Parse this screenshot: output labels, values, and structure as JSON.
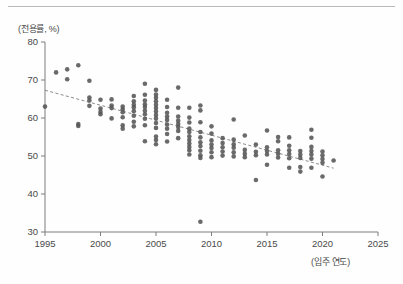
{
  "figure": {
    "top_rule": true,
    "background_color": "#fefefe"
  },
  "chart_data": {
    "type": "scatter",
    "title": "",
    "subtitle": "",
    "xlabel": "(입주 연도)",
    "ylabel": "(전용률, %)",
    "xlim": [
      1995,
      2025
    ],
    "ylim": [
      30,
      80
    ],
    "xticks": [
      1995,
      2000,
      2005,
      2010,
      2015,
      2020,
      2025
    ],
    "xtick_labels": [
      "1995",
      "2000",
      "2005",
      "2010",
      "2015",
      "2020",
      "2025"
    ],
    "yticks": [
      30,
      40,
      50,
      60,
      70,
      80
    ],
    "ytick_labels": [
      "30",
      "40",
      "50",
      "60",
      "70",
      "80"
    ],
    "grid": false,
    "legend": null,
    "marker": {
      "shape": "circle",
      "color": "#555555",
      "size_px": 4.6,
      "opacity": 0.88
    },
    "trendline": {
      "style": "dashed",
      "color": "#8a8a8a",
      "x_start": 1995,
      "y_start": 67.3,
      "x_end": 2021,
      "y_end": 46.8,
      "slope_per_year": -0.789
    },
    "series": [
      {
        "name": "전용률",
        "points": [
          [
            1995,
            63.0
          ],
          [
            1996,
            72.0
          ],
          [
            1997,
            72.8
          ],
          [
            1997,
            70.2
          ],
          [
            1998,
            73.9
          ],
          [
            1998,
            58.4
          ],
          [
            1998,
            57.9
          ],
          [
            1999,
            69.8
          ],
          [
            1999,
            65.4
          ],
          [
            1999,
            64.6
          ],
          [
            1999,
            63.2
          ],
          [
            2000,
            64.8
          ],
          [
            2000,
            62.5
          ],
          [
            2000,
            61.6
          ],
          [
            2000,
            61.0
          ],
          [
            2001,
            64.9
          ],
          [
            2001,
            63.3
          ],
          [
            2001,
            62.6
          ],
          [
            2001,
            59.9
          ],
          [
            2002,
            63.0
          ],
          [
            2002,
            62.3
          ],
          [
            2002,
            61.5
          ],
          [
            2002,
            60.2
          ],
          [
            2002,
            58.1
          ],
          [
            2002,
            57.2
          ],
          [
            2003,
            65.8
          ],
          [
            2003,
            64.4
          ],
          [
            2003,
            63.5
          ],
          [
            2003,
            62.8
          ],
          [
            2003,
            61.8
          ],
          [
            2003,
            60.6
          ],
          [
            2003,
            59.0
          ],
          [
            2003,
            57.8
          ],
          [
            2004,
            69.0
          ],
          [
            2004,
            66.1
          ],
          [
            2004,
            64.6
          ],
          [
            2004,
            63.6
          ],
          [
            2004,
            62.9
          ],
          [
            2004,
            61.9
          ],
          [
            2004,
            61.0
          ],
          [
            2004,
            59.8
          ],
          [
            2004,
            58.1
          ],
          [
            2004,
            53.9
          ],
          [
            2005,
            67.4
          ],
          [
            2005,
            66.2
          ],
          [
            2005,
            65.3
          ],
          [
            2005,
            64.4
          ],
          [
            2005,
            63.5
          ],
          [
            2005,
            62.6
          ],
          [
            2005,
            61.7
          ],
          [
            2005,
            60.8
          ],
          [
            2005,
            59.9
          ],
          [
            2005,
            58.7
          ],
          [
            2005,
            57.4
          ],
          [
            2005,
            55.1
          ],
          [
            2005,
            54.2
          ],
          [
            2005,
            53.1
          ],
          [
            2006,
            64.8
          ],
          [
            2006,
            62.9
          ],
          [
            2006,
            61.4
          ],
          [
            2006,
            60.4
          ],
          [
            2006,
            59.5
          ],
          [
            2006,
            58.3
          ],
          [
            2006,
            57.2
          ],
          [
            2006,
            55.8
          ],
          [
            2006,
            53.8
          ],
          [
            2007,
            68.0
          ],
          [
            2007,
            62.7
          ],
          [
            2007,
            60.4
          ],
          [
            2007,
            59.3
          ],
          [
            2007,
            58.4
          ],
          [
            2007,
            57.6
          ],
          [
            2007,
            56.6
          ],
          [
            2007,
            54.7
          ],
          [
            2008,
            62.7
          ],
          [
            2008,
            60.1
          ],
          [
            2008,
            58.8
          ],
          [
            2008,
            57.2
          ],
          [
            2008,
            56.3
          ],
          [
            2008,
            55.2
          ],
          [
            2008,
            54.2
          ],
          [
            2008,
            53.3
          ],
          [
            2008,
            52.4
          ],
          [
            2008,
            51.5
          ],
          [
            2008,
            50.4
          ],
          [
            2009,
            63.3
          ],
          [
            2009,
            62.0
          ],
          [
            2009,
            58.9
          ],
          [
            2009,
            56.3
          ],
          [
            2009,
            54.9
          ],
          [
            2009,
            53.6
          ],
          [
            2009,
            52.6
          ],
          [
            2009,
            51.4
          ],
          [
            2009,
            50.2
          ],
          [
            2009,
            49.5
          ],
          [
            2009,
            32.7
          ],
          [
            2010,
            57.8
          ],
          [
            2010,
            55.9
          ],
          [
            2010,
            54.1
          ],
          [
            2010,
            53.0
          ],
          [
            2010,
            52.1
          ],
          [
            2010,
            51.0
          ],
          [
            2010,
            49.7
          ],
          [
            2011,
            54.7
          ],
          [
            2011,
            53.4
          ],
          [
            2011,
            52.3
          ],
          [
            2011,
            51.2
          ],
          [
            2011,
            50.1
          ],
          [
            2012,
            59.6
          ],
          [
            2012,
            54.3
          ],
          [
            2012,
            53.1
          ],
          [
            2012,
            52.2
          ],
          [
            2012,
            51.0
          ],
          [
            2012,
            49.9
          ],
          [
            2013,
            55.4
          ],
          [
            2013,
            51.6
          ],
          [
            2013,
            50.6
          ],
          [
            2013,
            49.7
          ],
          [
            2014,
            53.0
          ],
          [
            2014,
            51.1
          ],
          [
            2014,
            50.2
          ],
          [
            2014,
            43.7
          ],
          [
            2015,
            56.7
          ],
          [
            2015,
            52.3
          ],
          [
            2015,
            51.3
          ],
          [
            2015,
            50.4
          ],
          [
            2015,
            47.7
          ],
          [
            2016,
            55.0
          ],
          [
            2016,
            53.9
          ],
          [
            2016,
            51.5
          ],
          [
            2016,
            50.6
          ],
          [
            2016,
            49.6
          ],
          [
            2017,
            54.9
          ],
          [
            2017,
            52.7
          ],
          [
            2017,
            51.5
          ],
          [
            2017,
            50.5
          ],
          [
            2017,
            49.4
          ],
          [
            2017,
            46.9
          ],
          [
            2018,
            51.3
          ],
          [
            2018,
            50.4
          ],
          [
            2018,
            49.5
          ],
          [
            2018,
            47.1
          ],
          [
            2018,
            45.9
          ],
          [
            2019,
            56.9
          ],
          [
            2019,
            54.8
          ],
          [
            2019,
            52.4
          ],
          [
            2019,
            51.3
          ],
          [
            2019,
            50.4
          ],
          [
            2019,
            49.3
          ],
          [
            2019,
            46.9
          ],
          [
            2020,
            51.2
          ],
          [
            2020,
            50.2
          ],
          [
            2020,
            49.2
          ],
          [
            2020,
            48.2
          ],
          [
            2020,
            44.6
          ],
          [
            2021,
            48.8
          ]
        ]
      }
    ]
  }
}
